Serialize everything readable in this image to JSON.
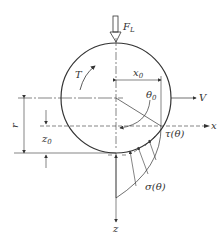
{
  "diagram": {
    "type": "wheel-soil contact mechanics",
    "labels": {
      "load": "F",
      "load_sub": "L",
      "torque": "T",
      "x0": "x",
      "x0_sub": "0",
      "theta0": "θ",
      "theta0_sub": "0",
      "velocity": "V",
      "x_axis": "x",
      "z_axis": "z",
      "radius": "r",
      "z0": "z",
      "z0_sub": "0",
      "shear": "τ(θ)",
      "normal": "σ(θ)"
    },
    "colors": {
      "line": "#333333",
      "background": "#ffffff"
    }
  }
}
